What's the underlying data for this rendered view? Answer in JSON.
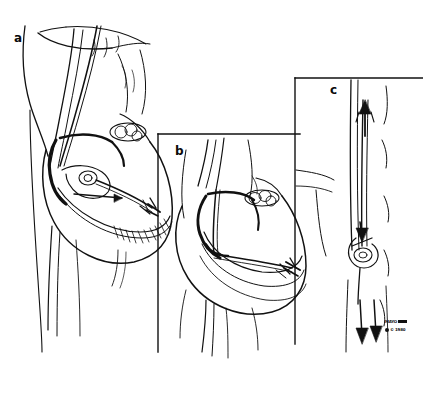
{
  "figure": {
    "kind": "medical-line-illustration",
    "background_color": "#ffffff",
    "ink_color": "#111111",
    "width": 423,
    "height": 394
  },
  "panels": [
    {
      "id": "a",
      "label": "a",
      "label_x": 14,
      "label_y": 32,
      "description": "Chest and heart in longitudinal section with catheter entering from superior vessel, crossing the valve, looping into the ventricle",
      "has_frame": false
    },
    {
      "id": "b",
      "label": "b",
      "label_x": 175,
      "label_y": 145,
      "description": "Second heart cross-section, catheter advanced further with tip seated in the ventricular apex",
      "has_frame": true,
      "frame_top_y": 134,
      "frame_left_x": 158
    },
    {
      "id": "c",
      "label": "c",
      "label_x": 330,
      "label_y": 84,
      "description": "Close-up of vessel segment with catheter loop and directional flow arrows pointing downward, arrowhead pointing up at top",
      "has_frame": true,
      "frame_top_y": 78,
      "frame_left_x": 295
    }
  ],
  "signature": {
    "line1": "MAYO",
    "line2": "© 1980",
    "position": "bottom-right"
  }
}
